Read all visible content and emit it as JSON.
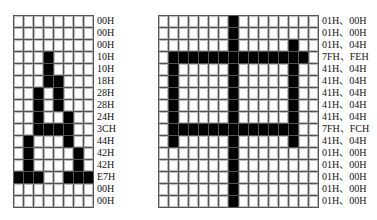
{
  "figures": [
    {
      "id": "char-A",
      "glyph": "A",
      "columns": 8,
      "rows": 16,
      "row_codes": [
        "00H",
        "00H",
        "00H",
        "10H",
        "10H",
        "18H",
        "28H",
        "28H",
        "24H",
        "3CH",
        "44H",
        "42H",
        "42H",
        "E7H",
        "00H",
        "00H"
      ],
      "row_bytes": [
        [
          "00"
        ],
        [
          "00"
        ],
        [
          "00"
        ],
        [
          "10"
        ],
        [
          "10"
        ],
        [
          "18"
        ],
        [
          "28"
        ],
        [
          "28"
        ],
        [
          "24"
        ],
        [
          "3C"
        ],
        [
          "44"
        ],
        [
          "42"
        ],
        [
          "42"
        ],
        [
          "E7"
        ],
        [
          "00"
        ],
        [
          "00"
        ]
      ]
    },
    {
      "id": "char-zhong",
      "glyph": "中",
      "columns": 16,
      "rows": 16,
      "row_codes": [
        "01H、00H",
        "01H、00H",
        "01H、04H",
        "7FH、FEH",
        "41H、04H",
        "41H、04H",
        "41H、04H",
        "41H、04H",
        "41H、04H",
        "7FH、FCH",
        "41H、04H",
        "01H、00H",
        "01H、00H",
        "01H、00H",
        "01H、00H",
        "01H、00H"
      ],
      "row_bytes": [
        [
          "01",
          "00"
        ],
        [
          "01",
          "00"
        ],
        [
          "01",
          "04"
        ],
        [
          "7F",
          "FE"
        ],
        [
          "41",
          "04"
        ],
        [
          "41",
          "04"
        ],
        [
          "41",
          "04"
        ],
        [
          "41",
          "04"
        ],
        [
          "41",
          "04"
        ],
        [
          "7F",
          "FC"
        ],
        [
          "41",
          "04"
        ],
        [
          "01",
          "00"
        ],
        [
          "01",
          "00"
        ],
        [
          "01",
          "00"
        ],
        [
          "01",
          "00"
        ],
        [
          "01",
          "00"
        ]
      ]
    }
  ],
  "colors": {
    "pixel_on": "#000000",
    "pixel_off": "#ffffff",
    "grid_line": "#555555"
  }
}
